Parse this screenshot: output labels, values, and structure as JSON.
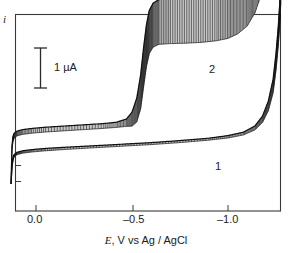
{
  "figure": {
    "y_axis_label": "i",
    "x_axis_title_symbol": "E",
    "x_axis_title_rest": ", V vs Ag / AgCl",
    "x_axis_title_full": "E, V vs Ag / AgCl",
    "scale_bar_label": "1  µA",
    "scale_bar_value": 1,
    "scale_bar_units": "µA",
    "curve_label_1": "1",
    "curve_label_2": "2",
    "frame_color": "#3a3a3a",
    "trace_color": "#111111"
  },
  "chart_data": {
    "type": "line",
    "title": "",
    "subtitle": "",
    "xlabel": "E, V vs Ag / AgCl",
    "ylabel": "i",
    "xlim": [
      0.13,
      -1.28
    ],
    "x_tick_values": [
      0.0,
      -0.5,
      -1.0
    ],
    "x_tick_labels": [
      "0.0",
      "–0.5",
      "–1.0"
    ],
    "y_tick_values": [],
    "y_tick_labels": [],
    "grid": false,
    "legend": "inline-curve-numbers",
    "annotations": [
      {
        "text": "1",
        "x": -0.88,
        "y_pixel": 167,
        "note": "label for lower curve"
      },
      {
        "text": "2",
        "x": -0.83,
        "y_pixel": 70,
        "note": "label for upper curve"
      },
      {
        "text": "1  µA",
        "note": "vertical I-beam scale bar, 40 px tall = 1 microamp"
      }
    ],
    "scale_bar": {
      "units": "µA",
      "value": 1,
      "pixel_height": 40
    },
    "series": [
      {
        "name": "1",
        "description": "lower sampled-current voltammogram, featureless baseline rising steeply near -1.2 V",
        "oscillating": true,
        "points": [
          [
            0.13,
            0.0
          ],
          [
            0.125,
            0.42
          ],
          [
            0.12,
            0.62
          ],
          [
            0.115,
            0.7
          ],
          [
            0.1,
            0.76
          ],
          [
            0.07,
            0.8
          ],
          [
            0.02,
            0.83
          ],
          [
            -0.05,
            0.86
          ],
          [
            -0.15,
            0.89
          ],
          [
            -0.3,
            0.93
          ],
          [
            -0.45,
            0.97
          ],
          [
            -0.6,
            1.01
          ],
          [
            -0.75,
            1.06
          ],
          [
            -0.9,
            1.12
          ],
          [
            -1.0,
            1.18
          ],
          [
            -1.08,
            1.26
          ],
          [
            -1.14,
            1.4
          ],
          [
            -1.18,
            1.62
          ],
          [
            -1.21,
            1.95
          ],
          [
            -1.235,
            2.45
          ],
          [
            -1.25,
            3.05
          ],
          [
            -1.262,
            3.7
          ],
          [
            -1.27,
            4.3
          ],
          [
            -1.275,
            4.8
          ]
        ],
        "amplitude": [
          0.0,
          0.05,
          0.06,
          0.06,
          0.06,
          0.06,
          0.06,
          0.06,
          0.055,
          0.05,
          0.05,
          0.05,
          0.05,
          0.05,
          0.06,
          0.07,
          0.1,
          0.16,
          0.24,
          0.34,
          0.42,
          0.48,
          0.52,
          0.55
        ]
      },
      {
        "name": "2",
        "description": "upper sampled-current voltammogram with large sigmoidal wave near -0.55 V and steep rise at -1.2 V",
        "oscillating": true,
        "points": [
          [
            0.13,
            0.0
          ],
          [
            0.125,
            0.9
          ],
          [
            0.12,
            1.12
          ],
          [
            0.115,
            1.2
          ],
          [
            0.1,
            1.26
          ],
          [
            0.07,
            1.3
          ],
          [
            0.02,
            1.33
          ],
          [
            -0.05,
            1.36
          ],
          [
            -0.15,
            1.39
          ],
          [
            -0.25,
            1.42
          ],
          [
            -0.35,
            1.45
          ],
          [
            -0.42,
            1.48
          ],
          [
            -0.47,
            1.53
          ],
          [
            -0.5,
            1.62
          ],
          [
            -0.525,
            1.85
          ],
          [
            -0.545,
            2.3
          ],
          [
            -0.56,
            2.9
          ],
          [
            -0.575,
            3.45
          ],
          [
            -0.59,
            3.8
          ],
          [
            -0.61,
            3.97
          ],
          [
            -0.64,
            4.05
          ],
          [
            -0.7,
            4.08
          ],
          [
            -0.78,
            4.1
          ],
          [
            -0.86,
            4.13
          ],
          [
            -0.94,
            4.18
          ],
          [
            -1.0,
            4.25
          ],
          [
            -1.05,
            4.36
          ],
          [
            -1.1,
            4.55
          ],
          [
            -1.14,
            4.85
          ],
          [
            -1.18,
            5.35
          ],
          [
            -1.21,
            6.0
          ],
          [
            -1.235,
            6.75
          ],
          [
            -1.25,
            7.4
          ],
          [
            -1.262,
            7.95
          ],
          [
            -1.27,
            8.35
          ],
          [
            -1.275,
            8.55
          ]
        ],
        "amplitude": [
          0.0,
          0.1,
          0.12,
          0.12,
          0.12,
          0.12,
          0.12,
          0.12,
          0.12,
          0.12,
          0.12,
          0.13,
          0.18,
          0.35,
          0.6,
          0.85,
          0.98,
          1.05,
          1.08,
          1.1,
          1.12,
          1.14,
          1.16,
          1.18,
          1.2,
          1.22,
          1.22,
          1.2,
          1.15,
          1.05,
          0.92,
          0.78,
          0.62,
          0.48,
          0.34,
          0.2
        ]
      }
    ]
  }
}
